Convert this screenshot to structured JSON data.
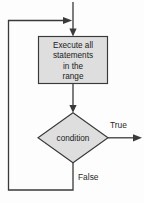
{
  "diagram": {
    "canvas": {
      "width": 144,
      "height": 203,
      "background": "#fdfdfd"
    },
    "colors": {
      "shape_fill": "#dedede",
      "shape_stroke": "#3a3a3a",
      "connector": "#3a3a3a",
      "text": "#1a1a1a"
    },
    "nodes": {
      "process": {
        "shape": "rectangle",
        "lines": [
          "Execute all",
          "statements",
          "in the",
          "range"
        ],
        "text": "Execute all statements in the range"
      },
      "decision": {
        "shape": "diamond",
        "label": "condition"
      }
    },
    "edges": {
      "entry": {
        "label": "",
        "from": "top",
        "to": "process"
      },
      "process_to_decision": {
        "label": "",
        "from": "process",
        "to": "decision"
      },
      "true_branch": {
        "label": "True",
        "from": "decision",
        "to": "exit"
      },
      "false_branch": {
        "label": "False",
        "from": "decision",
        "to": "process"
      }
    }
  }
}
